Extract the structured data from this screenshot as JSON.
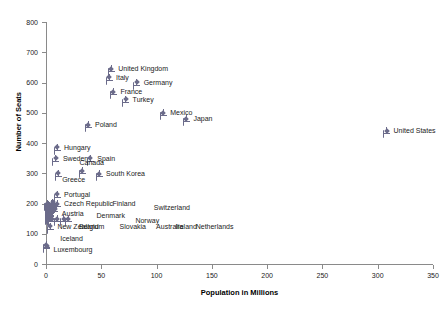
{
  "chart_data": {
    "type": "scatter",
    "title": "",
    "xlabel": "Population in Millions",
    "ylabel": "Number of Seats",
    "xlim": [
      0,
      350
    ],
    "ylim": [
      0,
      800
    ],
    "xticks": [
      0,
      50,
      100,
      150,
      200,
      250,
      300,
      350
    ],
    "yticks": [
      0,
      100,
      200,
      300,
      400,
      500,
      600,
      700,
      800
    ],
    "grid": false,
    "legend": "none",
    "marker_color": "#6b6b8a",
    "points": [
      {
        "label": "United Kingdom",
        "x": 59,
        "y": 646,
        "lx": 7,
        "ly": -3
      },
      {
        "label": "Italy",
        "x": 57,
        "y": 618,
        "lx": 7,
        "ly": -3
      },
      {
        "label": "Germany",
        "x": 82,
        "y": 601,
        "lx": 7,
        "ly": -3
      },
      {
        "label": "France",
        "x": 61,
        "y": 570,
        "lx": 7,
        "ly": -3
      },
      {
        "label": "Turkey",
        "x": 72,
        "y": 545,
        "lx": 7,
        "ly": -3
      },
      {
        "label": "Mexico",
        "x": 106,
        "y": 500,
        "lx": 7,
        "ly": -3
      },
      {
        "label": "Japan",
        "x": 127,
        "y": 480,
        "lx": 7,
        "ly": -3
      },
      {
        "label": "United States",
        "x": 308,
        "y": 440,
        "lx": 7,
        "ly": -3
      },
      {
        "label": "Poland",
        "x": 38,
        "y": 460,
        "lx": 7,
        "ly": -3
      },
      {
        "label": "Hungary",
        "x": 10,
        "y": 386,
        "lx": 7,
        "ly": -3
      },
      {
        "label": "Sweden",
        "x": 9,
        "y": 349,
        "lx": 7,
        "ly": -3
      },
      {
        "label": "Spain",
        "x": 40,
        "y": 350,
        "lx": 7,
        "ly": -3
      },
      {
        "label": "Canada",
        "x": 33,
        "y": 308,
        "lx": -3,
        "ly": -11
      },
      {
        "label": "Greece",
        "x": 11,
        "y": 300,
        "lx": 4,
        "ly": 3
      },
      {
        "label": "South Korea",
        "x": 48,
        "y": 299,
        "lx": 7,
        "ly": -3
      },
      {
        "label": "Portugal",
        "x": 10,
        "y": 230,
        "lx": 7,
        "ly": -3
      },
      {
        "label": "Czech Republic",
        "x": 10,
        "y": 200,
        "lx": 7,
        "ly": -3
      },
      {
        "label": "Finland",
        "x": 5,
        "y": 200,
        "lx": 61,
        "ly": -3
      },
      {
        "label": "Switzerland",
        "x": 7,
        "y": 196,
        "lx": 100,
        "ly": 0
      },
      {
        "label": "Austria",
        "x": 8,
        "y": 183,
        "lx": 7,
        "ly": 2
      },
      {
        "label": "Denmark",
        "x": 5,
        "y": 180,
        "lx": 45,
        "ly": 3
      },
      {
        "label": "Norway",
        "x": 4,
        "y": 169,
        "lx": 85,
        "ly": 5
      },
      {
        "label": "Ireland",
        "x": 4,
        "y": 166,
        "lx": 125,
        "ly": 10
      },
      {
        "label": "Belgium",
        "x": 10,
        "y": 150,
        "lx": 22,
        "ly": 5
      },
      {
        "label": "Slovakia",
        "x": 5,
        "y": 150,
        "lx": 68,
        "ly": 5
      },
      {
        "label": "Australia",
        "x": 20,
        "y": 150,
        "lx": 88,
        "ly": 5
      },
      {
        "label": "Netherlands",
        "x": 16,
        "y": 150,
        "lx": 132,
        "ly": 5
      },
      {
        "label": "New Zealand",
        "x": 4,
        "y": 125,
        "lx": 7,
        "ly": -3
      },
      {
        "label": "Iceland",
        "x": 0.3,
        "y": 63,
        "lx": 14,
        "ly": -9
      },
      {
        "label": "Luxembourg",
        "x": 0.5,
        "y": 60,
        "lx": 7,
        "ly": 1
      }
    ],
    "extra_markers": [
      {
        "x": 1,
        "y": 200
      },
      {
        "x": 2,
        "y": 196
      },
      {
        "x": 3,
        "y": 192
      },
      {
        "x": 2,
        "y": 188
      },
      {
        "x": 4,
        "y": 185
      },
      {
        "x": 3,
        "y": 181
      },
      {
        "x": 2,
        "y": 177
      },
      {
        "x": 3,
        "y": 173
      },
      {
        "x": 2,
        "y": 169
      },
      {
        "x": 3,
        "y": 165
      },
      {
        "x": 2,
        "y": 161
      },
      {
        "x": 3,
        "y": 157
      },
      {
        "x": 2,
        "y": 153
      },
      {
        "x": 4,
        "y": 150
      },
      {
        "x": 6,
        "y": 204
      },
      {
        "x": 5,
        "y": 193
      },
      {
        "x": 6,
        "y": 186
      },
      {
        "x": 4,
        "y": 178
      }
    ]
  }
}
